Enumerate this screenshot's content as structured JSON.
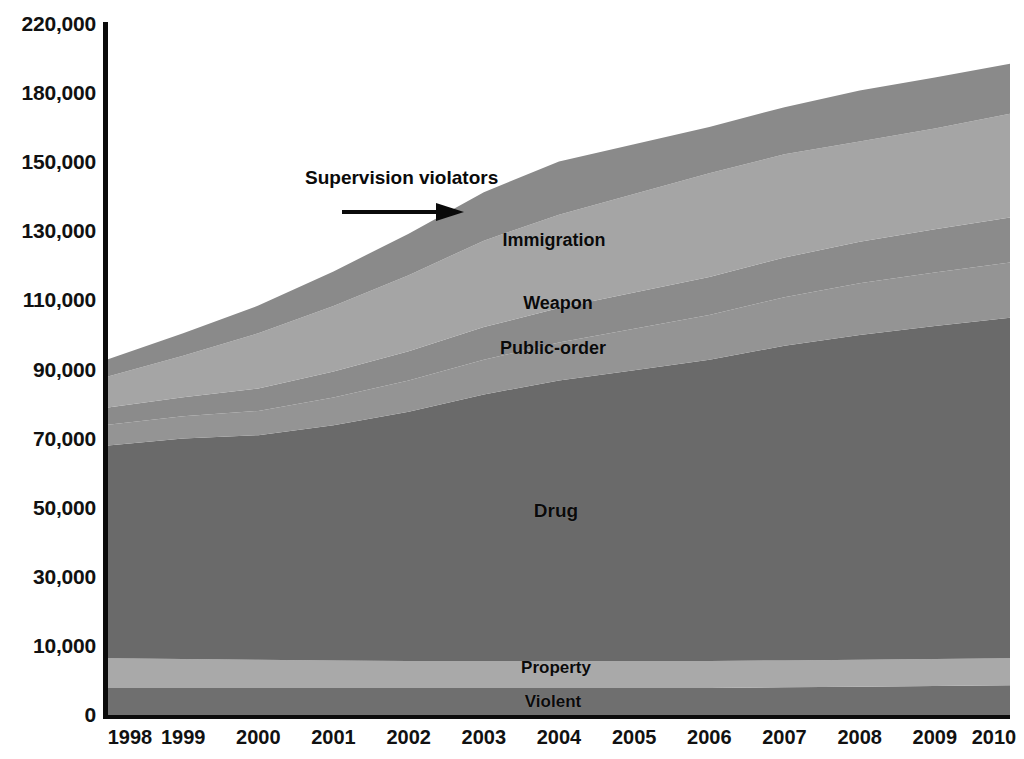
{
  "chart_data": {
    "type": "area",
    "stacked": true,
    "title": "",
    "subtitle": "",
    "xlabel": "",
    "ylabel": "",
    "grid": false,
    "legend_position": "inline-band-labels",
    "categories": [
      "1998",
      "1999",
      "2000",
      "2001",
      "2002",
      "2003",
      "2004",
      "2005",
      "2006",
      "2007",
      "2008",
      "2009",
      "2010"
    ],
    "x_tick_labels": [
      "1998",
      "1999",
      "2000",
      "2001",
      "2002",
      "2003",
      "2004",
      "2005",
      "2006",
      "2007",
      "2008",
      "2009",
      "2010"
    ],
    "y_tick_labels": [
      "220,000",
      "180,000",
      "150,000",
      "130,000",
      "110,000",
      "90,000",
      "70,000",
      "50,000",
      "30,000",
      "10,000",
      "0"
    ],
    "y_tick_values": [
      220000,
      180000,
      150000,
      130000,
      110000,
      90000,
      70000,
      50000,
      30000,
      10000,
      0
    ],
    "y_axis_note": "tick labels evenly spaced but values are non-uniform (220k,180k,150k,130k,110k,90k,70k,50k,30k,10k,0)",
    "ylim": [
      0,
      220000
    ],
    "series": [
      {
        "name": "Violent",
        "label": "Violent",
        "color": "#6f6f6f",
        "values": [
          3900,
          3900,
          3900,
          3900,
          3900,
          3900,
          3900,
          3900,
          3900,
          4000,
          4100,
          4200,
          4300
        ]
      },
      {
        "name": "Property",
        "label": "Property",
        "color": "#a9a9a9",
        "values": [
          4300,
          4200,
          4100,
          4000,
          3900,
          3900,
          3900,
          3900,
          3900,
          3900,
          3900,
          3900,
          3900
        ]
      },
      {
        "name": "Drug",
        "label": "Drug",
        "color": "#6a6a6a",
        "values": [
          59800,
          61900,
          63000,
          66000,
          70000,
          75000,
          79000,
          82000,
          85000,
          89000,
          92000,
          94500,
          96800
        ]
      },
      {
        "name": "Public-order",
        "label": "Public-order",
        "color": "#949494",
        "values": [
          6000,
          6500,
          7000,
          8000,
          9000,
          10000,
          11000,
          12000,
          13000,
          14000,
          15000,
          15500,
          16000
        ]
      },
      {
        "name": "Weapon",
        "label": "Weapon",
        "color": "#8b8b8b",
        "values": [
          5000,
          5500,
          6500,
          7500,
          8500,
          9500,
          10000,
          10500,
          11000,
          11500,
          12000,
          12500,
          13000
        ]
      },
      {
        "name": "Immigration",
        "label": "Immigration",
        "color": "#a5a5a5",
        "values": [
          9000,
          12000,
          16000,
          19000,
          22000,
          25000,
          27000,
          28500,
          30000,
          31000,
          32000,
          34000,
          37000
        ]
      },
      {
        "name": "Supervision violators",
        "label": "Supervision violators",
        "color": "#8a8a8a",
        "values": [
          5000,
          6500,
          8000,
          10000,
          12000,
          14000,
          15500,
          17000,
          18500,
          20500,
          22500,
          24500,
          26000
        ]
      }
    ],
    "totals": [
      93000,
      100500,
      108500,
      118400,
      129300,
      141300,
      150300,
      157800,
      165300,
      173900,
      181500,
      189100,
      197000
    ],
    "annotations": [
      {
        "id": "supervision-violators",
        "text": "Supervision violators",
        "arrow": "right-arrow",
        "x_px": 305,
        "y_px": 168
      }
    ],
    "band_labels": [
      {
        "id": "immigration",
        "text": "Immigration",
        "x_px": 554,
        "y_px": 240
      },
      {
        "id": "weapon",
        "text": "Weapon",
        "x_px": 558,
        "y_px": 303
      },
      {
        "id": "public-order",
        "text": "Public-order",
        "x_px": 553,
        "y_px": 348
      },
      {
        "id": "drug",
        "text": "Drug",
        "x_px": 556,
        "y_px": 510
      },
      {
        "id": "property",
        "text": "Property",
        "x_px": 556,
        "y_px": 667
      },
      {
        "id": "violent",
        "text": "Violent",
        "x_px": 553,
        "y_px": 701
      }
    ],
    "colors": {
      "background": "#ffffff",
      "axis": "#0b0b0b",
      "text": "#111111"
    }
  }
}
